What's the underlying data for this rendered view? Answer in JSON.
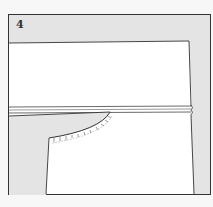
{
  "figure": {
    "step_number": "4",
    "colors": {
      "background_page": "#f7f7f7",
      "panel_shade": "#e4e4e4",
      "fabric": "#ffffff",
      "outline": "#333333"
    }
  }
}
